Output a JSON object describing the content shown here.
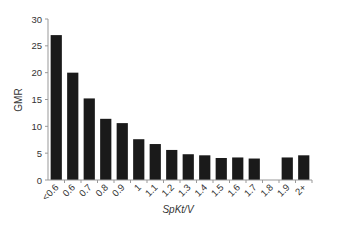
{
  "chart_data": {
    "type": "bar",
    "title": "",
    "xlabel": "SpKt/V",
    "ylabel": "GMR",
    "ylim": [
      0,
      30
    ],
    "yticks": [
      0,
      5,
      10,
      15,
      20,
      25,
      30
    ],
    "grid": false,
    "legend": null,
    "categories": [
      "<0.6",
      "0.6",
      "0.7",
      "0.8",
      "0.9",
      "1",
      "1.1",
      "1.2",
      "1.3",
      "1.4",
      "1.5",
      "1.6",
      "1.7",
      "1.8",
      "1.9",
      "2+"
    ],
    "values": [
      27,
      20,
      15.2,
      11.4,
      10.6,
      7.6,
      6.7,
      5.6,
      4.8,
      4.6,
      4.1,
      4.2,
      4.0,
      null,
      4.2,
      4.6
    ],
    "bar_color": "#1a1a1a"
  }
}
